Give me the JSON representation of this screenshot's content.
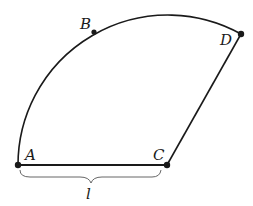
{
  "diagram": {
    "type": "circular sector (segment figure)",
    "stroke_color": "#1a1a1a",
    "background": "#ffffff",
    "points": [
      {
        "name": "A",
        "label": "A",
        "x": 18,
        "y": 165
      },
      {
        "name": "B",
        "label": "B",
        "x": 94,
        "y": 32
      },
      {
        "name": "C",
        "label": "C",
        "x": 167,
        "y": 165
      },
      {
        "name": "D",
        "label": "D",
        "x": 241,
        "y": 34
      }
    ],
    "edges": [
      {
        "from": "A",
        "to": "C",
        "kind": "line"
      },
      {
        "from": "C",
        "to": "D",
        "kind": "line"
      },
      {
        "from": "A",
        "to": "D",
        "kind": "arc",
        "through": "B",
        "center": "C"
      }
    ],
    "brace": {
      "from": "A",
      "to": "C",
      "label": "l"
    }
  }
}
